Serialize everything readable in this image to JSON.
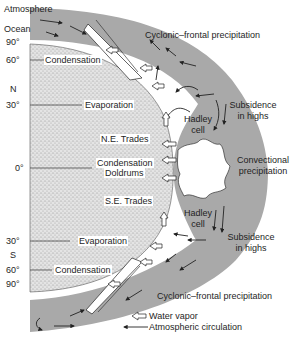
{
  "diagram": {
    "colors": {
      "atmosphere_band": "#a9a9a9",
      "ocean_fill": "#d6d6d6",
      "text": "#1e1e1e",
      "background": "#ffffff"
    },
    "layers": {
      "atmosphere": "Atmosphere",
      "ocean": "Ocean"
    },
    "latitudes": {
      "n90": "90°",
      "n60": "60°",
      "n_label": "N",
      "n30": "30°",
      "eq": "0°",
      "s30": "30°",
      "s_label": "S",
      "s60": "60°",
      "s90": "90°"
    },
    "ocean_processes": {
      "n60": "Condensation",
      "n30": "Evaporation",
      "ne_trades": "N.E. Trades",
      "eq_condensation": "Condensation",
      "doldrums": "Doldrums",
      "se_trades": "S.E. Trades",
      "s30": "Evaporation",
      "s60": "Condensation"
    },
    "atmosphere_processes": {
      "north_cyclonic": "Cyclonic–frontal precipitation",
      "north_subsidence_1": "Subsidence",
      "north_subsidence_2": "in highs",
      "convectional_1": "Convectional",
      "convectional_2": "precipitation",
      "south_subsidence_1": "Subsidence",
      "south_subsidence_2": "in highs",
      "south_cyclonic": "Cyclonic–frontal precipitation"
    },
    "cells": {
      "north_1": "Hadley",
      "north_2": "cell",
      "south_1": "Hadley",
      "south_2": "cell"
    },
    "legend": {
      "water_vapor_icon": "hollow-arrow-left",
      "water_vapor": "Water vapor",
      "circulation_icon": "line-arrow-left",
      "circulation": "Atmospheric circulation"
    }
  }
}
